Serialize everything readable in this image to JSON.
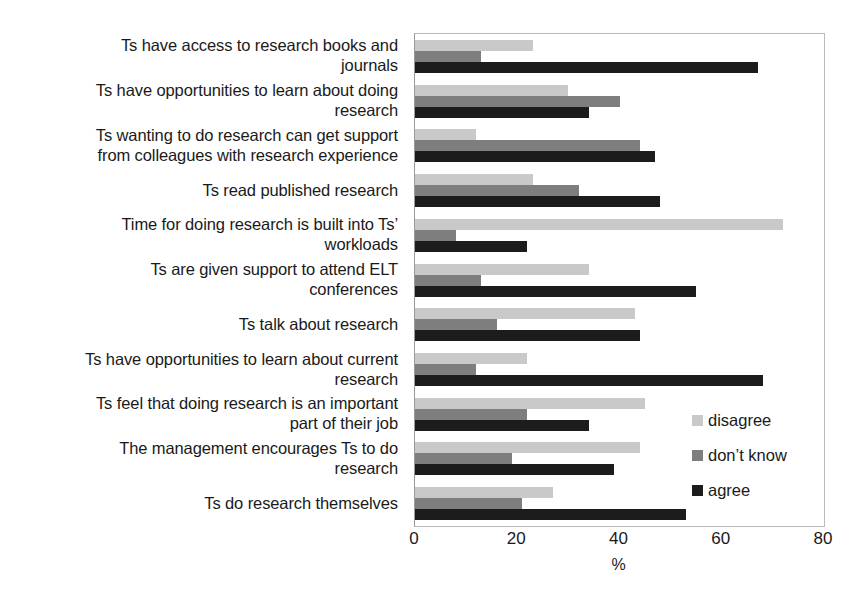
{
  "chart_data": {
    "type": "bar",
    "orientation": "horizontal",
    "title": "",
    "xlabel": "%",
    "ylabel": "",
    "xlim": [
      0,
      80
    ],
    "xticks": [
      "0",
      "20",
      "40",
      "60",
      "80"
    ],
    "grid": false,
    "legend_position": "right-inside",
    "categories": [
      "Ts have access to research books and journals",
      "Ts have opportunities to learn about doing research",
      "Ts wanting to do research can get support from colleagues with research experience",
      "Ts read published research",
      "Time for doing research is built into Ts’ workloads",
      "Ts are given support to attend ELT conferences",
      "Ts talk about research",
      "Ts have opportunities to learn about current research",
      "Ts feel that doing research is an important part of their job",
      "The management encourages Ts to do research",
      "Ts do research themselves"
    ],
    "category_lines": [
      [
        "Ts have access to research books and",
        "journals"
      ],
      [
        "Ts have opportunities to learn about doing",
        "research"
      ],
      [
        "Ts wanting to do research can get support",
        "from colleagues with research experience"
      ],
      [
        "Ts read published research"
      ],
      [
        "Time for doing research is built into Ts’",
        "workloads"
      ],
      [
        "Ts are given support to attend ELT",
        "conferences"
      ],
      [
        "Ts talk about research"
      ],
      [
        "Ts have opportunities to learn about current",
        "research"
      ],
      [
        "Ts feel that doing research is an important",
        "part of their job"
      ],
      [
        "The management encourages Ts to do",
        "research"
      ],
      [
        "Ts do research themselves"
      ]
    ],
    "series": [
      {
        "name": "disagree",
        "color": "#c9c9c9",
        "values": [
          23,
          30,
          12,
          23,
          72,
          34,
          43,
          22,
          45,
          44,
          27
        ]
      },
      {
        "name": "don’t know",
        "color": "#7e7e7e",
        "values": [
          13,
          40,
          44,
          32,
          8,
          13,
          16,
          12,
          22,
          19,
          21
        ]
      },
      {
        "name": "agree",
        "color": "#1c1c1c",
        "values": [
          67,
          34,
          47,
          48,
          22,
          55,
          44,
          68,
          34,
          39,
          53
        ]
      }
    ]
  },
  "legend": {
    "items": [
      {
        "label": "disagree",
        "key": "disagree"
      },
      {
        "label": "don’t know",
        "key": "dontknow"
      },
      {
        "label": "agree",
        "key": "agree"
      }
    ]
  }
}
